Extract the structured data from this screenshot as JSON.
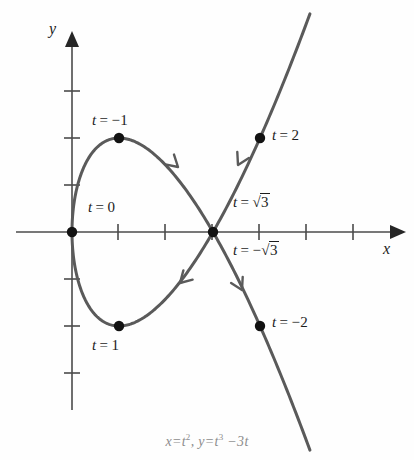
{
  "figure": {
    "kind": "parametric-curve-plot",
    "caption": "x = t², y = t³ − 3t",
    "axis_labels": {
      "x": "x",
      "y": "y"
    },
    "colors": {
      "curve": "#5a5a5a",
      "axis": "#4b4b4b",
      "dot": "#121212",
      "label_text": "#1c1c1c",
      "caption_text": "#8d8d8d",
      "background": "#fefefe"
    }
  },
  "chart_data": {
    "type": "line",
    "title": "",
    "subtitle": "",
    "caption": "x = t², y = t³ − 3t",
    "xlabel": "x",
    "ylabel": "y",
    "xlim": [
      -1,
      6.9
    ],
    "ylim": [
      -4.3,
      4.3
    ],
    "grid": false,
    "legend": "none",
    "parametric": {
      "x_of_t": "t^2",
      "y_of_t": "t^3 - 3t",
      "t_range": [
        -2.25,
        2.25
      ]
    },
    "axis_ticks": {
      "x": [
        1,
        2,
        3,
        4,
        5,
        6
      ],
      "y": [
        -3,
        -2,
        -1,
        1,
        2,
        3
      ],
      "tick_spacing_px": 47,
      "origin_px": [
        72,
        232
      ]
    },
    "points": [
      {
        "t": "-2",
        "label": "t = −2",
        "x": 4,
        "y": -2,
        "px": [
          258,
          325
        ]
      },
      {
        "t": "-1",
        "label": "t = −1",
        "x": 1,
        "y": 2,
        "px": [
          118,
          138
        ]
      },
      {
        "t": "0",
        "label": "t = 0",
        "x": 0,
        "y": 0,
        "px": [
          72,
          232
        ]
      },
      {
        "t": "1",
        "label": "t = 1",
        "x": 1,
        "y": -2,
        "px": [
          118,
          326
        ]
      },
      {
        "t": "2",
        "label": "t = 2",
        "x": 4,
        "y": 2,
        "px": [
          258,
          138
        ]
      },
      {
        "t": "sqrt3",
        "label": "t = √3",
        "x": 3,
        "y": 0,
        "px": [
          212,
          232
        ]
      },
      {
        "t": "-sqrt3",
        "label": "t = −√3",
        "x": 3,
        "y": 0,
        "px": [
          212,
          232
        ]
      }
    ],
    "labels": [
      {
        "name": "label-t-minus-1",
        "prefix": "t",
        "eq": "=",
        "value": "−1",
        "left": 92,
        "top": 113
      },
      {
        "name": "label-t-0",
        "prefix": "t",
        "eq": "=",
        "value": "0",
        "left": 88,
        "top": 200
      },
      {
        "name": "label-t-1",
        "prefix": "t",
        "eq": "=",
        "value": "1",
        "left": 92,
        "top": 338
      },
      {
        "name": "label-t-2",
        "prefix": "t",
        "eq": "=",
        "value": "2",
        "left": 272,
        "top": 128
      },
      {
        "name": "label-t-minus-2",
        "prefix": "t",
        "eq": "=",
        "value": "−2",
        "left": 272,
        "top": 315
      },
      {
        "name": "label-t-sqrt3",
        "prefix": "t",
        "eq": "=",
        "value": "√3",
        "left": 233,
        "top": 195,
        "radical": true,
        "radicand": "3",
        "sign": ""
      },
      {
        "name": "label-t-minus-sqrt3",
        "prefix": "t",
        "eq": "=",
        "value": "−√3",
        "left": 233,
        "top": 243,
        "radical": true,
        "radicand": "3",
        "sign": "−"
      }
    ],
    "direction_arrows": [
      {
        "name": "arrow-upper-branch",
        "at_px": [
          178,
          167
        ],
        "angle_deg": 222,
        "note": "t increasing toward t = -1 along upper branch"
      },
      {
        "name": "arrow-lower-left-branch",
        "at_px": [
          180,
          283
        ],
        "angle_deg": 315,
        "note": "t increasing from t = 1 toward crossing"
      },
      {
        "name": "arrow-right-branch-upper",
        "at_px": [
          238,
          165
        ],
        "angle_deg": 297,
        "note": "t increasing toward t = 2"
      },
      {
        "name": "arrow-right-branch-lower",
        "at_px": [
          242,
          290
        ],
        "angle_deg": 243,
        "note": "t increasing from t = -2 toward crossing"
      }
    ]
  }
}
